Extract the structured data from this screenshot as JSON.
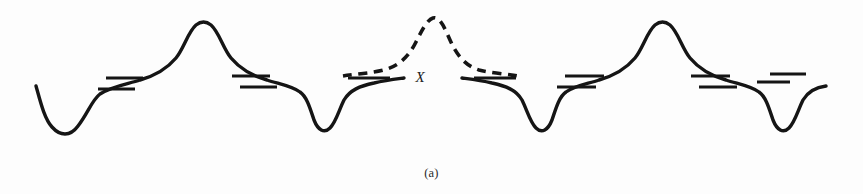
{
  "figure": {
    "caption": "(a)",
    "center_label": "X",
    "background_color": "#fdfdfd",
    "ink_color": "#151515",
    "width": 863,
    "height": 194
  },
  "chart_data": {
    "type": "line",
    "title": "",
    "subtitle": "",
    "xlabel": "",
    "ylabel": "",
    "xlim": [
      0,
      863
    ],
    "ylim": [
      194,
      0
    ],
    "grid": false,
    "legend": null,
    "axes_visible": false,
    "annotations": [
      {
        "text": "X",
        "x": 420,
        "y": 82,
        "style": "italic-serif"
      },
      {
        "text": "(a)",
        "x": 431,
        "y": 174,
        "style": "serif-caption"
      }
    ],
    "series": [
      {
        "name": "solid-potential-left",
        "style": "solid",
        "color": "#151515",
        "path": "M 36,86 C 40,100 44,118 52,127 C 60,136 70,137 78,126 C 88,113 92,100 100,94 C 112,86 128,84 140,80 C 154,76 166,70 176,58 C 184,48 188,32 196,25 C 201,21 206,21 211,25 C 219,32 223,48 231,58 C 241,70 253,76 267,80 C 279,84 292,86 300,92 C 307,97 310,108 314,120 C 318,130 324,134 330,128 C 336,122 339,110 344,100 C 350,90 360,86 374,83 C 386,80 396,79 404,78"
      },
      {
        "name": "solid-potential-center-right",
        "style": "solid",
        "color": "#151515",
        "path": "M 462,78 C 470,79 480,80 492,83 C 506,86 516,90 522,100 C 527,110 530,122 536,128 C 542,134 548,130 552,120 C 556,108 559,97 566,92 C 574,86 587,84 599,80 C 613,76 625,70 635,58 C 643,48 647,32 655,25 C 660,21 665,21 670,25 C 678,32 682,48 690,58 C 700,70 712,76 726,80 C 738,84 751,86 759,92 C 766,97 769,108 773,120 C 777,130 783,134 789,128 C 795,122 798,110 803,100 C 809,90 818,87 826,86"
      },
      {
        "name": "dashed-alternative-barrier",
        "style": "dashed",
        "color": "#151515",
        "path": "M 343,76 C 356,74 372,73 384,70 C 398,66 408,58 416,42 C 422,30 427,20 433,18 C 439,16 444,26 450,40 C 457,56 466,66 479,70 C 491,73 506,74 518,76"
      }
    ],
    "level_marks": [
      {
        "name": "level-1",
        "x1": 106,
        "y1": 78,
        "x2": 143,
        "y2": 78
      },
      {
        "name": "level-2",
        "x1": 98,
        "y1": 89,
        "x2": 135,
        "y2": 89
      },
      {
        "name": "level-3",
        "x1": 232,
        "y1": 76,
        "x2": 270,
        "y2": 76
      },
      {
        "name": "level-4",
        "x1": 240,
        "y1": 87,
        "x2": 277,
        "y2": 87
      },
      {
        "name": "level-5",
        "x1": 348,
        "y1": 78,
        "x2": 390,
        "y2": 78
      },
      {
        "name": "level-6",
        "x1": 474,
        "y1": 78,
        "x2": 516,
        "y2": 78
      },
      {
        "name": "level-7",
        "x1": 565,
        "y1": 76,
        "x2": 604,
        "y2": 76
      },
      {
        "name": "level-8",
        "x1": 557,
        "y1": 87,
        "x2": 596,
        "y2": 87
      },
      {
        "name": "level-9",
        "x1": 691,
        "y1": 76,
        "x2": 730,
        "y2": 76
      },
      {
        "name": "level-10",
        "x1": 699,
        "y1": 87,
        "x2": 737,
        "y2": 87
      },
      {
        "name": "level-11",
        "x1": 757,
        "y1": 82,
        "x2": 790,
        "y2": 82
      },
      {
        "name": "level-12",
        "x1": 770,
        "y1": 74,
        "x2": 806,
        "y2": 74
      }
    ],
    "features": {
      "peak_count": 2,
      "valley_count": 4,
      "dashed_peak_count": 1,
      "peak_positions_x": [
        206,
        665
      ],
      "valley_positions_x": [
        65,
        322,
        544,
        781
      ],
      "dashed_peak_position_x": 433
    }
  }
}
